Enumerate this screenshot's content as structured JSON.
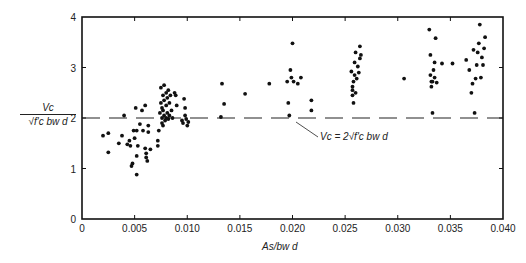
{
  "chart_data": {
    "type": "scatter",
    "title": "",
    "xlabel": "A_s/b_w d",
    "ylabel": "V_c / (sqrt(f'_c) b_w d)",
    "xlim": [
      0,
      0.04
    ],
    "ylim": [
      0,
      4
    ],
    "grid": false,
    "legend": null,
    "x_ticks": [
      "0",
      "0.005",
      "0.010",
      "0.015",
      "0.020",
      "0.025",
      "0.030",
      "0.035",
      "0.040"
    ],
    "y_ticks": [
      "0",
      "1",
      "2",
      "3",
      "4"
    ],
    "reference_line": {
      "y": 2,
      "style": "dashed",
      "label": "Vc = 2√f'c bw d"
    },
    "annotation": "Vc = 2√f'c bw d",
    "points": [
      [
        0.002,
        1.65
      ],
      [
        0.0025,
        1.7
      ],
      [
        0.0025,
        1.32
      ],
      [
        0.0035,
        1.5
      ],
      [
        0.0038,
        1.65
      ],
      [
        0.004,
        2.05
      ],
      [
        0.0043,
        1.48
      ],
      [
        0.0045,
        1.55
      ],
      [
        0.0046,
        1.45
      ],
      [
        0.0047,
        1.05
      ],
      [
        0.0048,
        1.1
      ],
      [
        0.0049,
        1.75
      ],
      [
        0.005,
        1.6
      ],
      [
        0.0051,
        2.2
      ],
      [
        0.0052,
        1.75
      ],
      [
        0.0052,
        1.25
      ],
      [
        0.0052,
        0.88
      ],
      [
        0.0053,
        1.45
      ],
      [
        0.0055,
        1.88
      ],
      [
        0.0057,
        2.15
      ],
      [
        0.0058,
        1.75
      ],
      [
        0.006,
        2.25
      ],
      [
        0.006,
        1.4
      ],
      [
        0.0061,
        1.3
      ],
      [
        0.0061,
        1.22
      ],
      [
        0.0062,
        1.15
      ],
      [
        0.0063,
        1.85
      ],
      [
        0.0063,
        1.72
      ],
      [
        0.0065,
        1.38
      ],
      [
        0.0072,
        1.45
      ],
      [
        0.0072,
        1.55
      ],
      [
        0.0073,
        1.75
      ],
      [
        0.0074,
        2.1
      ],
      [
        0.0075,
        2.3
      ],
      [
        0.0075,
        2.6
      ],
      [
        0.0076,
        2.2
      ],
      [
        0.0076,
        2.0
      ],
      [
        0.0076,
        1.9
      ],
      [
        0.0077,
        2.45
      ],
      [
        0.0077,
        2.15
      ],
      [
        0.0077,
        1.85
      ],
      [
        0.0078,
        2.65
      ],
      [
        0.0078,
        2.35
      ],
      [
        0.0078,
        2.05
      ],
      [
        0.0079,
        1.95
      ],
      [
        0.008,
        2.5
      ],
      [
        0.008,
        2.25
      ],
      [
        0.008,
        2.0
      ],
      [
        0.0081,
        2.4
      ],
      [
        0.0081,
        2.1
      ],
      [
        0.0082,
        2.55
      ],
      [
        0.0082,
        1.98
      ],
      [
        0.0083,
        2.3
      ],
      [
        0.0083,
        2.05
      ],
      [
        0.0084,
        2.45
      ],
      [
        0.0085,
        2.15
      ],
      [
        0.0086,
        2.0
      ],
      [
        0.0088,
        2.5
      ],
      [
        0.0089,
        2.45
      ],
      [
        0.009,
        2.25
      ],
      [
        0.0095,
        1.95
      ],
      [
        0.0096,
        1.9
      ],
      [
        0.0097,
        2.38
      ],
      [
        0.0098,
        2.2
      ],
      [
        0.0098,
        2.05
      ],
      [
        0.0099,
        1.98
      ],
      [
        0.01,
        1.85
      ],
      [
        0.0101,
        1.92
      ],
      [
        0.0133,
        2.68
      ],
      [
        0.0135,
        2.28
      ],
      [
        0.0132,
        2.02
      ],
      [
        0.0155,
        2.48
      ],
      [
        0.0178,
        2.68
      ],
      [
        0.0195,
        2.72
      ],
      [
        0.0196,
        2.3
      ],
      [
        0.0197,
        2.05
      ],
      [
        0.0198,
        2.95
      ],
      [
        0.0199,
        2.8
      ],
      [
        0.02,
        3.48
      ],
      [
        0.0201,
        2.72
      ],
      [
        0.0205,
        2.68
      ],
      [
        0.0208,
        2.8
      ],
      [
        0.0218,
        2.35
      ],
      [
        0.0218,
        2.15
      ],
      [
        0.0256,
        2.92
      ],
      [
        0.0257,
        2.62
      ],
      [
        0.0257,
        2.55
      ],
      [
        0.0257,
        2.45
      ],
      [
        0.0258,
        2.3
      ],
      [
        0.0258,
        2.72
      ],
      [
        0.0259,
        3.1
      ],
      [
        0.0259,
        2.85
      ],
      [
        0.026,
        3.3
      ],
      [
        0.026,
        2.5
      ],
      [
        0.0261,
        2.78
      ],
      [
        0.0262,
        3.02
      ],
      [
        0.0263,
        2.9
      ],
      [
        0.0264,
        3.42
      ],
      [
        0.0264,
        3.18
      ],
      [
        0.0265,
        3.25
      ],
      [
        0.0306,
        2.78
      ],
      [
        0.033,
        3.75
      ],
      [
        0.0331,
        3.25
      ],
      [
        0.0331,
        2.85
      ],
      [
        0.0332,
        2.72
      ],
      [
        0.0332,
        2.62
      ],
      [
        0.0333,
        2.1
      ],
      [
        0.0333,
        2.72
      ],
      [
        0.0334,
        2.95
      ],
      [
        0.0335,
        3.1
      ],
      [
        0.0335,
        2.8
      ],
      [
        0.0336,
        3.58
      ],
      [
        0.0337,
        2.7
      ],
      [
        0.0342,
        3.08
      ],
      [
        0.0352,
        3.08
      ],
      [
        0.0365,
        3.15
      ],
      [
        0.0368,
        2.95
      ],
      [
        0.037,
        2.5
      ],
      [
        0.0371,
        2.68
      ],
      [
        0.0372,
        3.35
      ],
      [
        0.0373,
        2.1
      ],
      [
        0.0374,
        2.78
      ],
      [
        0.0375,
        3.05
      ],
      [
        0.0376,
        3.3
      ],
      [
        0.0377,
        3.48
      ],
      [
        0.0378,
        3.85
      ],
      [
        0.0379,
        2.8
      ],
      [
        0.038,
        3.2
      ],
      [
        0.0381,
        3.05
      ],
      [
        0.0382,
        3.38
      ],
      [
        0.0383,
        3.6
      ]
    ]
  },
  "labels": {
    "y_num": "Vc",
    "y_den": "√f'c bw d",
    "x_title": "As/bw d",
    "annotation": "Vc  = 2√f'c bw d"
  }
}
